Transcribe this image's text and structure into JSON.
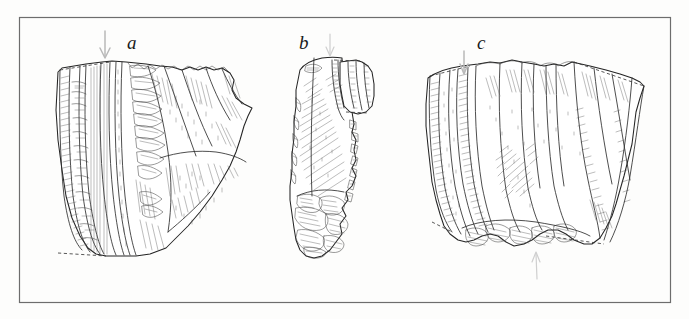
{
  "figure": {
    "kind": "scientific-line-drawing",
    "background_color": "#fdfdfc",
    "ink_color": "#2a2a2a",
    "frame_color": "#6d6d6d",
    "arrow_color": "#b9b9b9",
    "frame": {
      "x": 19,
      "y": 17,
      "width": 652,
      "height": 286
    },
    "labels": [
      {
        "id": "a",
        "text": "a",
        "x": 127,
        "y": 33,
        "style": "serif-italic"
      },
      {
        "id": "b",
        "text": "b",
        "x": 299,
        "y": 33,
        "style": "serif-italic"
      },
      {
        "id": "c",
        "text": "c",
        "x": 477,
        "y": 33,
        "style": "serif-italic"
      }
    ],
    "arrows": [
      {
        "id": "arrow-a",
        "direction": "down",
        "x": 105,
        "y_start": 30,
        "y_end": 60
      },
      {
        "id": "arrow-b",
        "direction": "down",
        "x": 330,
        "y_start": 33,
        "y_end": 57
      },
      {
        "id": "arrow-c-top",
        "direction": "down",
        "x": 464,
        "y_start": 50,
        "y_end": 75
      },
      {
        "id": "arrow-c-bottom",
        "direction": "up",
        "x": 537,
        "y_start": 280,
        "y_end": 252
      }
    ],
    "artifacts": [
      {
        "id": "a",
        "label": "a",
        "bbox": [
          55,
          60,
          205,
          215
        ],
        "description": "large core fragment with long parallel blade scars on left and stepped removals"
      },
      {
        "id": "b",
        "label": "b",
        "bbox": [
          290,
          52,
          90,
          210
        ],
        "description": "narrow elongated flake with retouched right margin and crushed distal end"
      },
      {
        "id": "c",
        "label": "c",
        "bbox": [
          425,
          58,
          220,
          215
        ],
        "description": "broad core tablet with ridged dorsal surface and dashed reconstructed outline"
      }
    ]
  }
}
